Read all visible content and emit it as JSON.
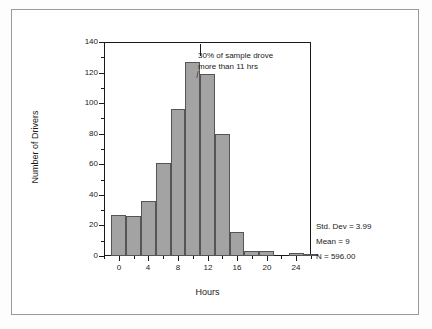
{
  "chart_data": {
    "type": "bar",
    "title": "",
    "subtitle": "",
    "xlabel": "Hours",
    "ylabel": "Number of Drivers",
    "xlim": [
      -2,
      26
    ],
    "ylim": [
      0,
      140
    ],
    "grid": false,
    "legend": "none",
    "bin_width": 2,
    "categories": [
      "0",
      "2",
      "4",
      "6",
      "8",
      "10",
      "12",
      "14",
      "16",
      "18",
      "20",
      "22",
      "24",
      "26"
    ],
    "bin_centers": [
      0,
      2,
      4,
      6,
      8,
      10,
      12,
      14,
      16,
      18,
      20,
      22,
      24,
      26
    ],
    "values": [
      27,
      26,
      36,
      61,
      96,
      127,
      119,
      80,
      16,
      3,
      3,
      0,
      2,
      1
    ],
    "x_ticks_major": [
      "0",
      "4",
      "8",
      "12",
      "16",
      "20",
      "24"
    ],
    "x_ticks_major_values": [
      0,
      4,
      8,
      12,
      16,
      20,
      24
    ],
    "x_ticks_minor_values": [
      -2,
      2,
      6,
      10,
      14,
      18,
      22,
      26
    ],
    "y_ticks_major": [
      "0",
      "20",
      "40",
      "60",
      "80",
      "100",
      "120",
      "140"
    ],
    "y_ticks_major_values": [
      0,
      20,
      40,
      60,
      80,
      100,
      120,
      140
    ],
    "y_ticks_minor_values": [
      10,
      30,
      50,
      70,
      90,
      110,
      130
    ],
    "bar_color": "#a3a3a3",
    "bar_border_color": "#555555",
    "axis_color": "#1a1a1a",
    "annotations": [
      {
        "text_line1": "30% of sample drove",
        "text_line2": "more than 11 hrs",
        "marker_x": 11
      }
    ]
  },
  "annotation": {
    "line1": "30% of sample drove",
    "line2": "more than 11 hrs"
  },
  "axes": {
    "x_title": "Hours",
    "y_title": "Number of Drivers"
  },
  "stats": {
    "std_dev": "Std. Dev = 3.99",
    "mean": "Mean = 9",
    "n": "N = 596.00"
  }
}
